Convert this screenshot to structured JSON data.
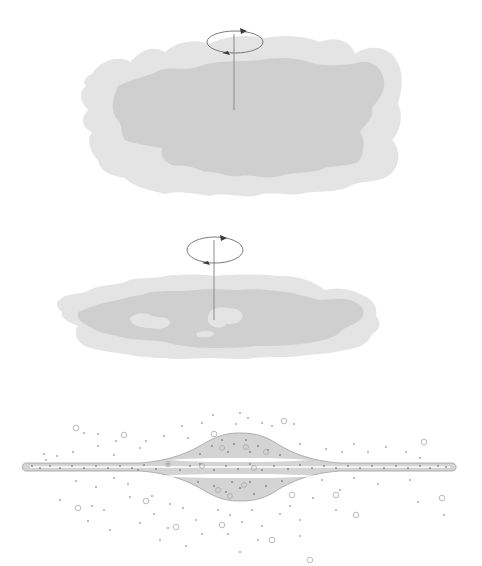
{
  "diagram": {
    "description": "Three-stage illustration of a rotating protogalactic gas cloud collapsing into a disk galaxy with central bulge and surrounding halo of stars",
    "colors": {
      "background": "#ffffff",
      "outer_gas": "#e4e4e4",
      "inner_gas": "#cfcfcf",
      "axis_line": "#8a8a8a",
      "rotation_ellipse": "#7a7a7a",
      "arrow_head": "#3a3a3a",
      "disk_fill": "#d4d4d4",
      "disk_outline": "#a0a0a0",
      "disk_midplane": "#ffffff",
      "star_dot": "#6a6a6a",
      "cluster_ring": "#a8a8a8"
    },
    "panels": [
      {
        "id": "stage-1",
        "label": "",
        "content": "large irregular rotating gas cloud",
        "rotation_indicator": true
      },
      {
        "id": "stage-2",
        "label": "",
        "content": "flattened collapsing cloud with forming clumps",
        "rotation_indicator": true
      },
      {
        "id": "stage-3",
        "label": "",
        "content": "thin disk with central bulge, halo stars and globular clusters"
      }
    ]
  }
}
